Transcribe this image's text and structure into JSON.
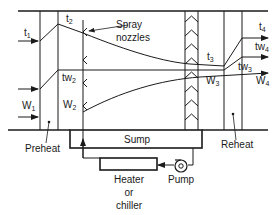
{
  "diagram": {
    "colors": {
      "line": "#1a1a1a",
      "background": "#ffffff"
    },
    "labels": {
      "t1": {
        "base": "t",
        "sub": "1"
      },
      "t2": {
        "base": "t",
        "sub": "2"
      },
      "t3": {
        "base": "t",
        "sub": "3"
      },
      "t4": {
        "base": "t",
        "sub": "4"
      },
      "tw2": {
        "base": "tw",
        "sub": "2"
      },
      "tw3": {
        "base": "tw",
        "sub": "3"
      },
      "tw4": {
        "base": "tw",
        "sub": "4"
      },
      "W1": {
        "base": "W",
        "sub": "1"
      },
      "W2": {
        "base": "W",
        "sub": "2"
      },
      "W3": {
        "base": "W",
        "sub": "3"
      },
      "W4": {
        "base": "W",
        "sub": "4"
      },
      "spray_nozzles_line1": "Spray",
      "spray_nozzles_line2": "nozzles",
      "sump": "Sump",
      "preheat": "Preheat",
      "reheat": "Reheat",
      "heater_line1": "Heater",
      "heater_line2": "or",
      "heater_line3": "chiller",
      "pump": "Pump"
    }
  }
}
